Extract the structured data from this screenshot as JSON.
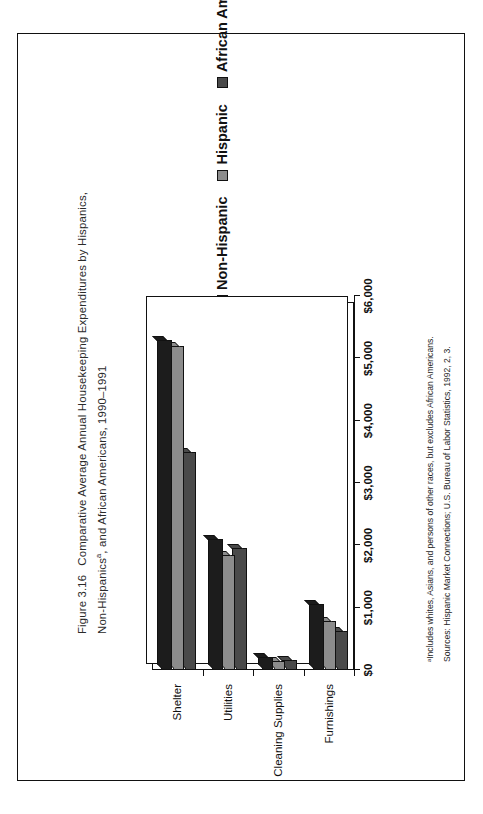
{
  "figure": {
    "number": "Figure 3.16",
    "caption_line1": "Comparative Average Annual Housekeeping Expenditures by Hispanics,",
    "caption_line2_a": "Non-Hispanics",
    "caption_line2_sup": "a",
    "caption_line2_b": ", and African Americans, 1990–1991"
  },
  "legend": {
    "items": [
      {
        "label": "Non-Hispanic",
        "color": "#1c1c1c"
      },
      {
        "label": "Hispanic",
        "color": "#8c8c8c"
      },
      {
        "label": "African American",
        "color": "#4a4a4a"
      }
    ]
  },
  "notes": {
    "footnote": "ᵃIncludes whites, Asians, and persons of other races, but excludes African Americans.",
    "source": "Sources: Hispanic Market Connections; U.S. Bureau of Labor Statistics, 1992, 2, 3."
  },
  "chart_data": {
    "type": "bar",
    "orientation": "vertical",
    "categories": [
      "Shelter",
      "Utilities",
      "Cleaning Supplies",
      "Furnishings"
    ],
    "series": [
      {
        "name": "Non-Hispanic",
        "color": "#1c1c1c",
        "values": [
          5300,
          2100,
          210,
          1060
        ]
      },
      {
        "name": "Hispanic",
        "color": "#8c8c8c",
        "values": [
          5200,
          1850,
          150,
          790
        ]
      },
      {
        "name": "African American",
        "color": "#4a4a4a",
        "values": [
          3500,
          1950,
          160,
          620
        ]
      }
    ],
    "xlabel": "",
    "ylabel": "",
    "ylim": [
      0,
      6000
    ],
    "yticks": [
      0,
      1000,
      2000,
      3000,
      4000,
      5000,
      6000
    ],
    "ytick_labels": [
      "$0",
      "$1,000",
      "$2,000",
      "$3,000",
      "$4,000",
      "$5,000",
      "$6,000"
    ],
    "grid": false,
    "legend_position": "top-right"
  }
}
